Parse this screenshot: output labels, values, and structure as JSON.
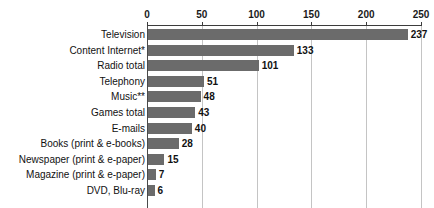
{
  "chart_data": {
    "type": "bar",
    "orientation": "horizontal",
    "title": "",
    "subtitle": "",
    "xlabel": "",
    "ylabel": "",
    "xlim": [
      0,
      250
    ],
    "ylim": null,
    "grid": true,
    "grid_axis": "x",
    "legend": false,
    "legend_position": "none",
    "axis_position": "top",
    "tick_labels": [
      "0",
      "50",
      "100",
      "150",
      "200",
      "250"
    ],
    "tick_values": [
      0,
      50,
      100,
      150,
      200,
      250
    ],
    "categories": [
      "Television",
      "Content Internet*",
      "Radio total",
      "Telephony",
      "Music**",
      "Games total",
      "E-mails",
      "Books (print & e-books)",
      "Newspaper (print & e-paper)",
      "Magazine (print & e-paper)",
      "DVD, Blu-ray"
    ],
    "values": [
      237,
      133,
      101,
      51,
      48,
      43,
      40,
      28,
      15,
      7,
      6
    ],
    "value_labels": [
      "237",
      "133",
      "101",
      "51",
      "48",
      "43",
      "40",
      "28",
      "15",
      "7",
      "6"
    ],
    "series": [
      {
        "name": "",
        "values": [
          237,
          133,
          101,
          51,
          48,
          43,
          40,
          28,
          15,
          7,
          6
        ]
      }
    ]
  },
  "colors": {
    "bar": "#6b6b6b",
    "gridline": "#c4c4c4",
    "axis": "#3c3c3c",
    "text": "#111111",
    "background": "#ffffff"
  }
}
